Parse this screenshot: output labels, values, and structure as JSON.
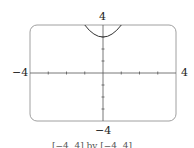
{
  "chart_data": {
    "type": "line",
    "title": "",
    "caption": "[−4, 4] by [−4, 4]",
    "xlabel": "",
    "ylabel": "",
    "xlim": [
      -4,
      4
    ],
    "ylim": [
      -4,
      4
    ],
    "x_ticks": [
      -3,
      -2,
      -1,
      1,
      2,
      3
    ],
    "y_ticks": [
      -3,
      -2,
      -1,
      1,
      2,
      3
    ],
    "grid": false,
    "axis_labels": {
      "x_min": "−4",
      "x_max": "4",
      "y_min": "−4",
      "y_max": "4"
    },
    "series": [
      {
        "name": "curve",
        "function": "y = x^2 + 3",
        "x": [
          -1.0,
          -0.75,
          -0.5,
          -0.25,
          0,
          0.25,
          0.5,
          0.75,
          1.0
        ],
        "y": [
          4.0,
          3.5625,
          3.25,
          3.0625,
          3.0,
          3.0625,
          3.25,
          3.5625,
          4.0
        ]
      }
    ],
    "colors": {
      "frame": "#9a9a9a",
      "axis": "#555555",
      "curve": "#333333"
    }
  }
}
